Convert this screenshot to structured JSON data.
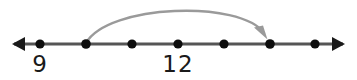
{
  "figure": {
    "background_color": "#ffffff",
    "width": 357,
    "height": 80
  },
  "chart_data": {
    "type": "number-line",
    "title": "",
    "xlabel": "",
    "ylabel": "",
    "axis": {
      "color": "#555555",
      "stroke_width": 3,
      "y": 44,
      "x_start": 12,
      "x_end": 345,
      "left_arrow": true,
      "right_arrow": true,
      "arrow_head_length": 13,
      "arrow_head_half_width": 7
    },
    "points": [
      {
        "index": 1,
        "x": 40,
        "label": "9",
        "labeled": true,
        "radius": 4.6,
        "color": "#0d0d0d"
      },
      {
        "index": 2,
        "x": 86,
        "label": "",
        "labeled": false,
        "radius": 4.8,
        "color": "#0d0d0d"
      },
      {
        "index": 3,
        "x": 132,
        "label": "",
        "labeled": false,
        "radius": 4.6,
        "color": "#0d0d0d"
      },
      {
        "index": 4,
        "x": 178,
        "label": "12",
        "labeled": true,
        "radius": 4.6,
        "color": "#0d0d0d"
      },
      {
        "index": 5,
        "x": 224,
        "label": "",
        "labeled": false,
        "radius": 4.6,
        "color": "#0d0d0d"
      },
      {
        "index": 6,
        "x": 270,
        "label": "",
        "labeled": false,
        "radius": 4.8,
        "color": "#0d0d0d"
      },
      {
        "index": 7,
        "x": 315,
        "label": "",
        "labeled": false,
        "radius": 4.6,
        "color": "#0d0d0d"
      }
    ],
    "tick_labels": [
      {
        "text": "9",
        "x": 40,
        "y": 53
      },
      {
        "text": "12",
        "x": 178,
        "y": 53
      }
    ],
    "jump_arc": {
      "from_x": 86,
      "to_x": 270,
      "from_y": 44,
      "to_y": 37,
      "apex_y": 5,
      "color": "#9a9a9a",
      "stroke_width": 2.4,
      "arrowhead": true,
      "arrowhead_tip_x": 267,
      "arrowhead_tip_y": 38,
      "direction": "left-to-right"
    },
    "legend": [],
    "annotations": []
  }
}
